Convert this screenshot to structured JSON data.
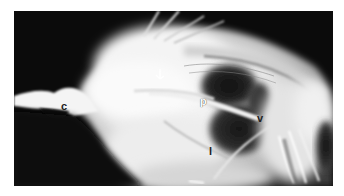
{
  "figure": {
    "type": "radiograph",
    "labels": [
      {
        "id": "c",
        "text": "c",
        "x": 61,
        "y": 101
      },
      {
        "id": "p",
        "text": "p",
        "x": 200,
        "y": 96
      },
      {
        "id": "v",
        "text": "v",
        "x": 257,
        "y": 113
      },
      {
        "id": "l",
        "text": "l",
        "x": 208,
        "y": 146
      }
    ],
    "markers": [
      {
        "id": "arrowhead",
        "type": "arrowhead-icon",
        "x": 158,
        "y": 72
      }
    ],
    "colors": {
      "background": "#ffffff",
      "film_dark": "#0b0b0b",
      "tissue_bright": "#f2f2f2",
      "label_text": "#ffffff"
    }
  }
}
